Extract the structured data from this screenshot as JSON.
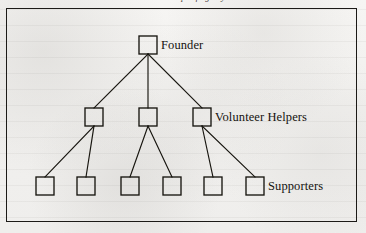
{
  "figure": {
    "caption": "Outline Shape of Agency",
    "background_color": "#f4f3f1",
    "ink_color": "#17150f",
    "frame": {
      "x": 6,
      "y": 8,
      "width": 351,
      "height": 214
    }
  },
  "chart_data": {
    "type": "diagram",
    "diagram_kind": "organisation-chart",
    "title": "Outline Shape of Agency",
    "orientation": "top-down",
    "node_shape": "square",
    "node_size": 18,
    "levels": [
      {
        "level": 1,
        "label": "Founder",
        "count": 1
      },
      {
        "level": 2,
        "label": "Volunteer Helpers",
        "count": 3
      },
      {
        "level": 3,
        "label": "Supporters",
        "count": 6
      }
    ],
    "nodes": [
      {
        "id": "founder",
        "level": 1,
        "x": 148,
        "y": 45,
        "parent": null
      },
      {
        "id": "helper-1",
        "level": 2,
        "x": 94,
        "y": 117,
        "parent": "founder"
      },
      {
        "id": "helper-2",
        "level": 2,
        "x": 148,
        "y": 117,
        "parent": "founder"
      },
      {
        "id": "helper-3",
        "level": 2,
        "x": 202,
        "y": 117,
        "parent": "founder"
      },
      {
        "id": "supporter-1",
        "level": 3,
        "x": 45,
        "y": 186,
        "parent": "helper-1"
      },
      {
        "id": "supporter-2",
        "level": 3,
        "x": 86,
        "y": 186,
        "parent": "helper-1"
      },
      {
        "id": "supporter-3",
        "level": 3,
        "x": 130,
        "y": 186,
        "parent": "helper-2"
      },
      {
        "id": "supporter-4",
        "level": 3,
        "x": 172,
        "y": 186,
        "parent": "helper-2"
      },
      {
        "id": "supporter-5",
        "level": 3,
        "x": 213,
        "y": 186,
        "parent": "helper-3"
      },
      {
        "id": "supporter-6",
        "level": 3,
        "x": 255,
        "y": 186,
        "parent": "helper-3"
      }
    ],
    "edges": [
      {
        "from": "founder",
        "to": "helper-1"
      },
      {
        "from": "founder",
        "to": "helper-2"
      },
      {
        "from": "founder",
        "to": "helper-3"
      },
      {
        "from": "helper-1",
        "to": "supporter-1"
      },
      {
        "from": "helper-1",
        "to": "supporter-2"
      },
      {
        "from": "helper-2",
        "to": "supporter-3"
      },
      {
        "from": "helper-2",
        "to": "supporter-4"
      },
      {
        "from": "helper-3",
        "to": "supporter-5"
      },
      {
        "from": "helper-3",
        "to": "supporter-6"
      }
    ],
    "annotations": [
      {
        "id": "label-founder",
        "text": "Founder",
        "anchor_node": "founder",
        "x": 161,
        "y": 38
      },
      {
        "id": "label-helpers",
        "text": "Volunteer Helpers",
        "anchor_node": "helper-3",
        "x": 215,
        "y": 110
      },
      {
        "id": "label-supporters",
        "text": "Supporters",
        "anchor_node": "supporter-6",
        "x": 268,
        "y": 179
      }
    ]
  }
}
